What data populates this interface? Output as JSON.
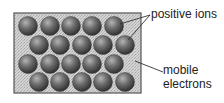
{
  "diagram": {
    "lattice": {
      "box": {
        "x": 14,
        "y": 13,
        "width": 127,
        "height": 80,
        "fill": "#c9c9c9",
        "stroke": "#555555"
      },
      "ion_radius": 9.5,
      "ions": [
        {
          "row": 1,
          "cx": 28,
          "cy": 26
        },
        {
          "row": 1,
          "cx": 50,
          "cy": 26
        },
        {
          "row": 1,
          "cx": 71,
          "cy": 26
        },
        {
          "row": 1,
          "cx": 92,
          "cy": 26
        },
        {
          "row": 1,
          "cx": 114,
          "cy": 26
        },
        {
          "row": 2,
          "cx": 39,
          "cy": 45
        },
        {
          "row": 2,
          "cx": 60,
          "cy": 45
        },
        {
          "row": 2,
          "cx": 82,
          "cy": 45
        },
        {
          "row": 2,
          "cx": 103,
          "cy": 45
        },
        {
          "row": 2,
          "cx": 125,
          "cy": 45
        },
        {
          "row": 3,
          "cx": 28,
          "cy": 64
        },
        {
          "row": 3,
          "cx": 50,
          "cy": 64
        },
        {
          "row": 3,
          "cx": 71,
          "cy": 64
        },
        {
          "row": 3,
          "cx": 92,
          "cy": 64
        },
        {
          "row": 3,
          "cx": 114,
          "cy": 64
        },
        {
          "row": 4,
          "cx": 39,
          "cy": 82
        },
        {
          "row": 4,
          "cx": 60,
          "cy": 82
        },
        {
          "row": 4,
          "cx": 82,
          "cy": 82
        },
        {
          "row": 4,
          "cx": 103,
          "cy": 82
        },
        {
          "row": 4,
          "cx": 125,
          "cy": 82
        }
      ]
    },
    "labels": {
      "positive_ions": "positive ions",
      "mobile_line1": "mobile",
      "mobile_line2": "electrons"
    },
    "leader_lines": [
      {
        "target": "positive ions",
        "x1": 150,
        "y1": 15,
        "x2": 120,
        "y2": 24
      },
      {
        "target": "positive ions",
        "x1": 150,
        "y1": 15,
        "x2": 128,
        "y2": 40
      },
      {
        "target": "mobile electrons",
        "x1": 135,
        "y1": 61,
        "x2": 163,
        "y2": 72
      }
    ],
    "colors": {
      "ion_highlight": "#b4b4b4",
      "ion_mid": "#6e6e6e",
      "ion_dark": "#2e2e2e",
      "line": "#333333",
      "text": "#222222"
    }
  }
}
